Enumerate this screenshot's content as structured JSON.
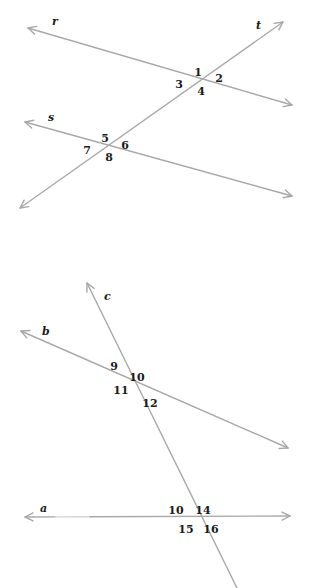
{
  "figures": [
    {
      "id": "top",
      "description": "Two lines r and s cut by transversal t",
      "lines": [
        {
          "name": "r",
          "label": "r",
          "from": [
            28,
            28
          ],
          "to": [
            292,
            105
          ],
          "arrow_start": true,
          "arrow_end": true,
          "label_pos": [
            52,
            25
          ]
        },
        {
          "name": "s",
          "label": "s",
          "from": [
            25,
            122
          ],
          "to": [
            292,
            196
          ],
          "arrow_start": true,
          "arrow_end": true,
          "label_pos": [
            48,
            121
          ]
        },
        {
          "name": "t",
          "label": "t",
          "from": [
            20,
            208
          ],
          "to": [
            283,
            22
          ],
          "arrow_start": true,
          "arrow_end": true,
          "label_pos": [
            256,
            29
          ]
        }
      ],
      "angles": [
        {
          "label": "1",
          "pos": [
            198,
            73
          ]
        },
        {
          "label": "2",
          "pos": [
            219,
            79
          ]
        },
        {
          "label": "3",
          "pos": [
            179,
            85
          ]
        },
        {
          "label": "4",
          "pos": [
            201,
            92
          ]
        },
        {
          "label": "5",
          "pos": [
            105,
            139
          ]
        },
        {
          "label": "6",
          "pos": [
            125,
            146
          ]
        },
        {
          "label": "7",
          "pos": [
            87,
            151
          ]
        },
        {
          "label": "8",
          "pos": [
            109,
            158
          ]
        }
      ]
    },
    {
      "id": "bottom",
      "description": "Two lines a and b cut by transversal c",
      "lines": [
        {
          "name": "c",
          "label": "c",
          "from": [
            87,
            283
          ],
          "to": [
            237,
            588
          ],
          "arrow_start": true,
          "arrow_end": false,
          "label_pos": [
            104,
            300
          ]
        },
        {
          "name": "b",
          "label": "b",
          "from": [
            21,
            331
          ],
          "to": [
            288,
            448
          ],
          "arrow_start": true,
          "arrow_end": true,
          "label_pos": [
            42,
            335
          ]
        },
        {
          "name": "a",
          "label": "a",
          "from": [
            25,
            517
          ],
          "to": [
            290,
            516
          ],
          "arrow_start": true,
          "arrow_end": true,
          "gap": [
            55,
            90
          ],
          "label_pos": [
            40,
            512
          ]
        }
      ],
      "angles": [
        {
          "label": "9",
          "pos": [
            114,
            367
          ]
        },
        {
          "label": "10",
          "pos": [
            137,
            378
          ]
        },
        {
          "label": "11",
          "pos": [
            121,
            391
          ]
        },
        {
          "label": "12",
          "pos": [
            150,
            404
          ]
        },
        {
          "label": "10",
          "pos": [
            176,
            511
          ]
        },
        {
          "label": "14",
          "pos": [
            203,
            511
          ]
        },
        {
          "label": "15",
          "pos": [
            186,
            530
          ]
        },
        {
          "label": "16",
          "pos": [
            211,
            530
          ]
        }
      ]
    }
  ],
  "colors": {
    "line": "#a8a8a8",
    "text": "#1a1a1a",
    "background": "#ffffff"
  }
}
